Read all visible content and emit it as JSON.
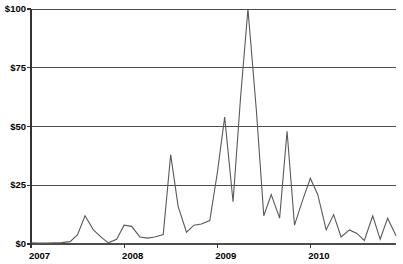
{
  "chart_data": {
    "type": "line",
    "title": "",
    "xlabel": "",
    "ylabel": "",
    "ylim": [
      0,
      100
    ],
    "xlim": [
      2007.0,
      2010.92
    ],
    "grid": true,
    "legend": false,
    "y_ticks": [
      0,
      25,
      50,
      75,
      100
    ],
    "y_tick_labels": [
      "$0",
      "$25",
      "$50",
      "$75",
      "$100"
    ],
    "x_ticks": [
      2007,
      2008,
      2009,
      2010
    ],
    "x_tick_labels": [
      "2007",
      "2008",
      "2009",
      "2010"
    ],
    "series": [
      {
        "name": "value",
        "color": "#595959",
        "x": [
          2007.0,
          2007.08,
          2007.17,
          2007.25,
          2007.33,
          2007.42,
          2007.5,
          2007.58,
          2007.67,
          2007.75,
          2007.83,
          2007.92,
          2008.0,
          2008.08,
          2008.17,
          2008.25,
          2008.33,
          2008.42,
          2008.5,
          2008.58,
          2008.67,
          2008.75,
          2008.83,
          2008.92,
          2009.0,
          2009.08,
          2009.17,
          2009.25,
          2009.33,
          2009.42,
          2009.5,
          2009.58,
          2009.67,
          2009.75,
          2009.83,
          2009.92,
          2010.0,
          2010.08,
          2010.17,
          2010.25,
          2010.33,
          2010.42,
          2010.5,
          2010.58,
          2010.67,
          2010.75,
          2010.83,
          2010.92
        ],
        "y": [
          0.5,
          0.4,
          0.4,
          0.5,
          0.6,
          1.0,
          4.0,
          12.0,
          6.0,
          3.0,
          0.5,
          2.0,
          8.0,
          7.5,
          3.0,
          2.5,
          3.0,
          4.0,
          38.0,
          16.0,
          5.0,
          8.0,
          8.5,
          10.0,
          30.0,
          54.0,
          18.0,
          62.0,
          100.0,
          57.0,
          12.0,
          21.0,
          11.0,
          48.0,
          8.0,
          19.0,
          28.0,
          21.0,
          6.0,
          12.5,
          3.0,
          6.0,
          4.5,
          1.5,
          12.0,
          2.0,
          11.0,
          3.5
        ]
      }
    ]
  },
  "axis": {
    "y_labels": [
      "$100",
      "$75",
      "$50",
      "$25",
      "$0"
    ],
    "x_labels": [
      "2007",
      "2008",
      "2009",
      "2010"
    ]
  }
}
